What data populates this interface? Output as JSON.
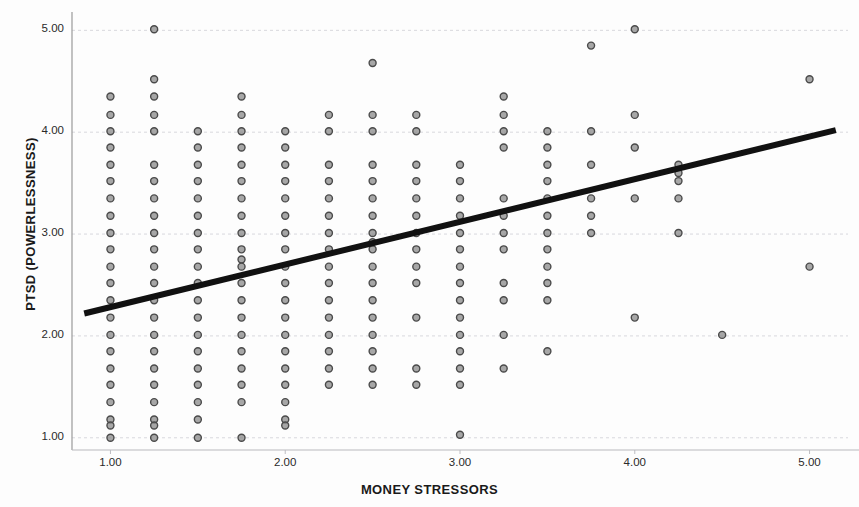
{
  "chart_data": {
    "type": "scatter",
    "title": "",
    "xlabel": "MONEY STRESSORS",
    "ylabel": "PTSD (POWERLESSNESS)",
    "xlim": [
      0.78,
      5.22
    ],
    "ylim": [
      0.88,
      5.18
    ],
    "xticks": [
      "1.00",
      "2.00",
      "3.00",
      "4.00",
      "5.00"
    ],
    "xtick_values": [
      1.0,
      2.0,
      3.0,
      4.0,
      5.0
    ],
    "yticks": [
      "1.00",
      "2.00",
      "3.00",
      "4.00",
      "5.00"
    ],
    "ytick_values": [
      1.0,
      2.0,
      3.0,
      4.0,
      5.0
    ],
    "grid": true,
    "grid_axis": "y",
    "legend": "none",
    "marker_color": "#8a8a8a",
    "marker_edge_color": "#4a4a4a",
    "marker_size": 7,
    "fitline": {
      "label": "linear fit",
      "color": "#111111",
      "width": 6,
      "x": [
        0.85,
        5.15
      ],
      "y": [
        2.22,
        4.02
      ]
    },
    "points": [
      [
        1.0,
        4.35
      ],
      [
        1.0,
        4.17
      ],
      [
        1.0,
        4.01
      ],
      [
        1.0,
        3.85
      ],
      [
        1.0,
        3.68
      ],
      [
        1.0,
        3.52
      ],
      [
        1.0,
        3.35
      ],
      [
        1.0,
        3.18
      ],
      [
        1.0,
        3.01
      ],
      [
        1.0,
        2.85
      ],
      [
        1.0,
        2.68
      ],
      [
        1.0,
        2.52
      ],
      [
        1.0,
        2.35
      ],
      [
        1.0,
        2.18
      ],
      [
        1.0,
        2.01
      ],
      [
        1.0,
        1.85
      ],
      [
        1.0,
        1.68
      ],
      [
        1.0,
        1.52
      ],
      [
        1.0,
        1.35
      ],
      [
        1.0,
        1.18
      ],
      [
        1.0,
        1.12
      ],
      [
        1.0,
        1.0
      ],
      [
        1.25,
        5.01
      ],
      [
        1.25,
        4.52
      ],
      [
        1.25,
        4.35
      ],
      [
        1.25,
        4.17
      ],
      [
        1.25,
        4.01
      ],
      [
        1.25,
        3.68
      ],
      [
        1.25,
        3.52
      ],
      [
        1.25,
        3.35
      ],
      [
        1.25,
        3.18
      ],
      [
        1.25,
        3.01
      ],
      [
        1.25,
        2.85
      ],
      [
        1.25,
        2.68
      ],
      [
        1.25,
        2.52
      ],
      [
        1.25,
        2.35
      ],
      [
        1.25,
        2.18
      ],
      [
        1.25,
        2.01
      ],
      [
        1.25,
        1.85
      ],
      [
        1.25,
        1.68
      ],
      [
        1.25,
        1.52
      ],
      [
        1.25,
        1.35
      ],
      [
        1.25,
        1.18
      ],
      [
        1.25,
        1.12
      ],
      [
        1.25,
        1.0
      ],
      [
        1.5,
        4.01
      ],
      [
        1.5,
        3.85
      ],
      [
        1.5,
        3.68
      ],
      [
        1.5,
        3.52
      ],
      [
        1.5,
        3.35
      ],
      [
        1.5,
        3.18
      ],
      [
        1.5,
        3.01
      ],
      [
        1.5,
        2.85
      ],
      [
        1.5,
        2.68
      ],
      [
        1.5,
        2.52
      ],
      [
        1.5,
        2.35
      ],
      [
        1.5,
        2.18
      ],
      [
        1.5,
        2.01
      ],
      [
        1.5,
        1.85
      ],
      [
        1.5,
        1.68
      ],
      [
        1.5,
        1.52
      ],
      [
        1.5,
        1.35
      ],
      [
        1.5,
        1.18
      ],
      [
        1.5,
        1.0
      ],
      [
        1.75,
        4.35
      ],
      [
        1.75,
        4.17
      ],
      [
        1.75,
        4.01
      ],
      [
        1.75,
        3.85
      ],
      [
        1.75,
        3.68
      ],
      [
        1.75,
        3.52
      ],
      [
        1.75,
        3.35
      ],
      [
        1.75,
        3.18
      ],
      [
        1.75,
        3.01
      ],
      [
        1.75,
        2.85
      ],
      [
        1.75,
        2.75
      ],
      [
        1.75,
        2.68
      ],
      [
        1.75,
        2.52
      ],
      [
        1.75,
        2.35
      ],
      [
        1.75,
        2.18
      ],
      [
        1.75,
        2.01
      ],
      [
        1.75,
        1.85
      ],
      [
        1.75,
        1.68
      ],
      [
        1.75,
        1.52
      ],
      [
        1.75,
        1.35
      ],
      [
        1.75,
        1.0
      ],
      [
        2.0,
        4.01
      ],
      [
        2.0,
        3.85
      ],
      [
        2.0,
        3.68
      ],
      [
        2.0,
        3.52
      ],
      [
        2.0,
        3.35
      ],
      [
        2.0,
        3.18
      ],
      [
        2.0,
        3.01
      ],
      [
        2.0,
        2.85
      ],
      [
        2.0,
        2.68
      ],
      [
        2.0,
        2.52
      ],
      [
        2.0,
        2.35
      ],
      [
        2.0,
        2.18
      ],
      [
        2.0,
        2.01
      ],
      [
        2.0,
        1.85
      ],
      [
        2.0,
        1.68
      ],
      [
        2.0,
        1.52
      ],
      [
        2.0,
        1.35
      ],
      [
        2.0,
        1.18
      ],
      [
        2.0,
        1.12
      ],
      [
        2.25,
        4.17
      ],
      [
        2.25,
        4.01
      ],
      [
        2.25,
        3.68
      ],
      [
        2.25,
        3.52
      ],
      [
        2.25,
        3.35
      ],
      [
        2.25,
        3.18
      ],
      [
        2.25,
        3.01
      ],
      [
        2.25,
        2.85
      ],
      [
        2.25,
        2.68
      ],
      [
        2.25,
        2.52
      ],
      [
        2.25,
        2.35
      ],
      [
        2.25,
        2.18
      ],
      [
        2.25,
        2.01
      ],
      [
        2.25,
        1.85
      ],
      [
        2.25,
        1.68
      ],
      [
        2.25,
        1.52
      ],
      [
        2.5,
        4.68
      ],
      [
        2.5,
        4.17
      ],
      [
        2.5,
        4.01
      ],
      [
        2.5,
        3.68
      ],
      [
        2.5,
        3.52
      ],
      [
        2.5,
        3.35
      ],
      [
        2.5,
        3.18
      ],
      [
        2.5,
        3.01
      ],
      [
        2.5,
        2.92
      ],
      [
        2.5,
        2.85
      ],
      [
        2.5,
        2.68
      ],
      [
        2.5,
        2.52
      ],
      [
        2.5,
        2.35
      ],
      [
        2.5,
        2.18
      ],
      [
        2.5,
        2.01
      ],
      [
        2.5,
        1.85
      ],
      [
        2.5,
        1.68
      ],
      [
        2.5,
        1.52
      ],
      [
        2.75,
        4.17
      ],
      [
        2.75,
        4.01
      ],
      [
        2.75,
        3.68
      ],
      [
        2.75,
        3.52
      ],
      [
        2.75,
        3.35
      ],
      [
        2.75,
        3.18
      ],
      [
        2.75,
        3.01
      ],
      [
        2.75,
        2.85
      ],
      [
        2.75,
        2.68
      ],
      [
        2.75,
        2.52
      ],
      [
        2.75,
        2.18
      ],
      [
        2.75,
        1.68
      ],
      [
        2.75,
        1.52
      ],
      [
        3.0,
        3.68
      ],
      [
        3.0,
        3.52
      ],
      [
        3.0,
        3.35
      ],
      [
        3.0,
        3.18
      ],
      [
        3.0,
        3.01
      ],
      [
        3.0,
        2.85
      ],
      [
        3.0,
        2.68
      ],
      [
        3.0,
        2.52
      ],
      [
        3.0,
        2.35
      ],
      [
        3.0,
        2.18
      ],
      [
        3.0,
        2.01
      ],
      [
        3.0,
        1.85
      ],
      [
        3.0,
        1.68
      ],
      [
        3.0,
        1.52
      ],
      [
        3.0,
        1.03
      ],
      [
        3.25,
        4.35
      ],
      [
        3.25,
        4.17
      ],
      [
        3.25,
        4.01
      ],
      [
        3.25,
        3.85
      ],
      [
        3.25,
        3.35
      ],
      [
        3.25,
        3.18
      ],
      [
        3.25,
        3.01
      ],
      [
        3.25,
        2.85
      ],
      [
        3.25,
        2.52
      ],
      [
        3.25,
        2.35
      ],
      [
        3.25,
        2.01
      ],
      [
        3.25,
        1.68
      ],
      [
        3.5,
        4.01
      ],
      [
        3.5,
        3.85
      ],
      [
        3.5,
        3.68
      ],
      [
        3.5,
        3.52
      ],
      [
        3.5,
        3.35
      ],
      [
        3.5,
        3.18
      ],
      [
        3.5,
        3.01
      ],
      [
        3.5,
        2.85
      ],
      [
        3.5,
        2.68
      ],
      [
        3.5,
        2.52
      ],
      [
        3.5,
        2.35
      ],
      [
        3.5,
        1.85
      ],
      [
        3.75,
        4.85
      ],
      [
        3.75,
        4.01
      ],
      [
        3.75,
        3.68
      ],
      [
        3.75,
        3.35
      ],
      [
        3.75,
        3.18
      ],
      [
        3.75,
        3.01
      ],
      [
        4.0,
        5.01
      ],
      [
        4.0,
        4.17
      ],
      [
        4.0,
        3.85
      ],
      [
        4.0,
        3.35
      ],
      [
        4.0,
        2.18
      ],
      [
        4.25,
        3.68
      ],
      [
        4.25,
        3.6
      ],
      [
        4.25,
        3.52
      ],
      [
        4.25,
        3.35
      ],
      [
        4.25,
        3.01
      ],
      [
        4.5,
        2.01
      ],
      [
        5.0,
        4.52
      ],
      [
        5.0,
        2.68
      ]
    ]
  }
}
